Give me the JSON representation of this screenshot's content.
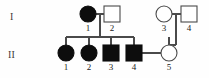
{
  "chart_data": {
    "type": "diagram",
    "diagram_type": "pedigree",
    "title": "",
    "generations": [
      {
        "label": "I",
        "label_x": 12,
        "label_y": 20,
        "symbol_y": 14,
        "number_y": 31,
        "individuals": [
          {
            "id": "I-1",
            "number": "1",
            "sex": "female",
            "shape": "circle",
            "affected": true,
            "x": 88,
            "r": 8
          },
          {
            "id": "I-2",
            "number": "2",
            "sex": "male",
            "shape": "square",
            "affected": false,
            "x": 112,
            "r": 8
          },
          {
            "id": "I-3",
            "number": "3",
            "sex": "female",
            "shape": "circle",
            "affected": false,
            "x": 164,
            "r": 8
          },
          {
            "id": "I-4",
            "number": "4",
            "sex": "male",
            "shape": "square",
            "affected": false,
            "x": 189,
            "r": 8
          }
        ]
      },
      {
        "label": "II",
        "label_x": 12,
        "label_y": 58,
        "symbol_y": 53,
        "number_y": 70,
        "individuals": [
          {
            "id": "II-1",
            "number": "1",
            "sex": "female",
            "shape": "circle",
            "affected": true,
            "x": 66,
            "r": 8
          },
          {
            "id": "II-2",
            "number": "2",
            "sex": "female",
            "shape": "circle",
            "affected": true,
            "x": 89,
            "r": 8
          },
          {
            "id": "II-3",
            "number": "3",
            "sex": "male",
            "shape": "square",
            "affected": true,
            "x": 111,
            "r": 8
          },
          {
            "id": "II-4",
            "number": "4",
            "sex": "male",
            "shape": "square",
            "affected": true,
            "x": 134,
            "r": 8
          },
          {
            "id": "II-5",
            "number": "5",
            "sex": "female",
            "shape": "circle",
            "affected": false,
            "x": 169,
            "r": 8
          }
        ]
      }
    ],
    "matings": [
      {
        "id": "mating-I1-I2",
        "partners": [
          "I-1",
          "I-2"
        ],
        "x1": 96,
        "x2": 104,
        "y": 14
      },
      {
        "id": "mating-I3-I4",
        "partners": [
          "I-3",
          "I-4"
        ],
        "x1": 172,
        "x2": 181,
        "y": 14
      },
      {
        "id": "mating-II4-II5",
        "partners": [
          "II-4",
          "II-5"
        ],
        "x1": 142,
        "x2": 161,
        "y": 53
      }
    ],
    "sibships": [
      {
        "id": "sibship-I1-I2",
        "parents": [
          "I-1",
          "I-2"
        ],
        "descent_x": 100,
        "descent_y1": 14,
        "descent_y2": 37,
        "sib_line_y": 37,
        "sib_line_x1": 66,
        "sib_line_x2": 134,
        "children": [
          "II-1",
          "II-2",
          "II-3",
          "II-4"
        ],
        "child_drops": [
          {
            "x": 66,
            "y1": 37,
            "y2": 45
          },
          {
            "x": 89,
            "y1": 37,
            "y2": 45
          },
          {
            "x": 111,
            "y1": 37,
            "y2": 45
          },
          {
            "x": 134,
            "y1": 37,
            "y2": 45
          }
        ]
      },
      {
        "id": "sibship-I3-I4",
        "parents": [
          "I-3",
          "I-4"
        ],
        "descent_x": 176,
        "descent_y1": 14,
        "descent_y2": 45,
        "sib_line_y": 45,
        "sib_line_x1": 169,
        "sib_line_x2": 176,
        "children": [
          "II-5"
        ],
        "child_drops": [
          {
            "x": 169,
            "y1": 37,
            "y2": 45
          }
        ]
      }
    ],
    "colors": {
      "background": "#fefefe",
      "line": "#4a4a4a",
      "affected_fill": "#0d0d0d",
      "unaffected_fill": "#ffffff",
      "number_text": "#1a1a1a",
      "generation_text": "#3a3a3a"
    },
    "legend": {
      "filled_meaning": "affected",
      "open_meaning": "unaffected",
      "circle_meaning": "female",
      "square_meaning": "male"
    }
  }
}
